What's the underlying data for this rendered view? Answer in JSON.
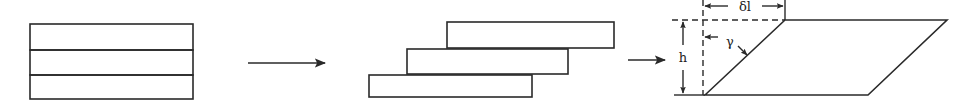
{
  "diagram": {
    "stroke_color": "#2a2a2a",
    "background": "#ffffff",
    "stages": [
      {
        "name": "undeformed-stack",
        "layers": 3
      },
      {
        "name": "sheared-layers",
        "layers": 3
      },
      {
        "name": "sheared-parallelogram"
      }
    ],
    "arrows": [
      "transition-arrow-1",
      "transition-arrow-2"
    ],
    "labels": {
      "displacement": "δl",
      "height": "h",
      "shear_angle": "γ"
    }
  }
}
